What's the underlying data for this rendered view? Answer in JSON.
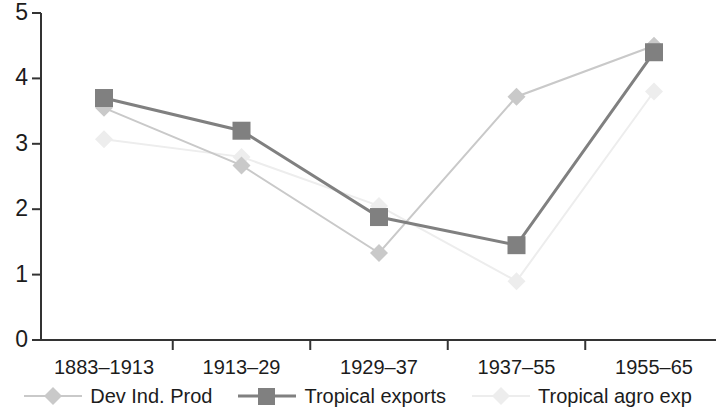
{
  "chart_data": {
    "type": "line",
    "title": "",
    "xlabel": "",
    "ylabel": "",
    "categories": [
      "1883–1913",
      "1913–29",
      "1929–37",
      "1937–55",
      "1955–65"
    ],
    "ylim": [
      0,
      5
    ],
    "y_ticks": [
      "0",
      "1",
      "2",
      "3",
      "4",
      "5"
    ],
    "grid": false,
    "legend_position": "bottom",
    "series": [
      {
        "name": "Dev Ind. Prod",
        "values": [
          3.55,
          2.67,
          1.33,
          3.72,
          4.5
        ],
        "color": "#c9c9c9",
        "marker": "diamond"
      },
      {
        "name": "Tropical exports",
        "values": [
          3.7,
          3.2,
          1.88,
          1.45,
          4.4
        ],
        "color": "#808080",
        "marker": "square"
      },
      {
        "name": "Tropical agro exp",
        "values": [
          3.07,
          2.8,
          2.05,
          0.9,
          3.8
        ],
        "color": "#ededed",
        "marker": "diamond"
      }
    ]
  },
  "axis": {
    "line_color": "#333333"
  }
}
